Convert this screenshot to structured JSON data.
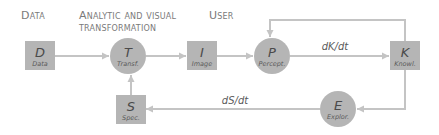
{
  "headers": {
    "data": "Data",
    "analytic_line1": "Analytic and visual",
    "analytic_line2": "transformation",
    "user": "User"
  },
  "nodes": [
    {
      "id": "D",
      "symbol": "D",
      "label": "Data",
      "shape": "square"
    },
    {
      "id": "T",
      "symbol": "T",
      "label": "Transf.",
      "shape": "circle"
    },
    {
      "id": "I",
      "symbol": "I",
      "label": "Image",
      "shape": "square"
    },
    {
      "id": "P",
      "symbol": "P",
      "label": "Percept.",
      "shape": "circle"
    },
    {
      "id": "K",
      "symbol": "K",
      "label": "Knowl.",
      "shape": "square"
    },
    {
      "id": "E",
      "symbol": "E",
      "label": "Explor.",
      "shape": "circle"
    },
    {
      "id": "S",
      "symbol": "S",
      "label": "Spec.",
      "shape": "square"
    }
  ],
  "edges": [
    {
      "from": "D",
      "to": "T",
      "label": ""
    },
    {
      "from": "T",
      "to": "I",
      "label": ""
    },
    {
      "from": "I",
      "to": "P",
      "label": ""
    },
    {
      "from": "P",
      "to": "K",
      "label": "dK/dt"
    },
    {
      "from": "K",
      "to": "P",
      "label": ""
    },
    {
      "from": "K",
      "to": "E",
      "label": ""
    },
    {
      "from": "E",
      "to": "S",
      "label": "dS/dt"
    },
    {
      "from": "S",
      "to": "T",
      "label": ""
    }
  ],
  "colors": {
    "node_fill": "#b5b5b5",
    "edge": "#c4c4c4",
    "header_text": "#7a7a7a"
  }
}
